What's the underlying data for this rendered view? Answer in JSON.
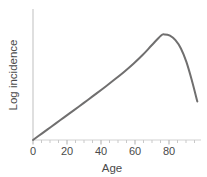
{
  "chart_data": {
    "type": "line",
    "title": "",
    "xlabel": "Age",
    "ylabel": "Log incidence",
    "xlim": [
      0,
      92
    ],
    "ylim": [
      0,
      100
    ],
    "grid": false,
    "legend": null,
    "x_ticks": [
      0,
      20,
      40,
      60,
      80
    ],
    "x_tick_labels": [
      "0",
      "20",
      "40",
      "60",
      "80"
    ],
    "x_minor_tick_step": 5,
    "y_ticks": [],
    "y_tick_labels": [],
    "series": [
      {
        "name": "Log incidence by age",
        "color": "#706f6f",
        "line_width": 2,
        "x": [
          0,
          5,
          10,
          15,
          20,
          25,
          30,
          35,
          40,
          45,
          50,
          55,
          60,
          65,
          70,
          72,
          75,
          78,
          81,
          84,
          87,
          90
        ],
        "y": [
          0,
          5.2,
          10.4,
          15.6,
          20.8,
          26.0,
          31.3,
          36.6,
          42.0,
          47.6,
          53.4,
          59.6,
          66.4,
          74.0,
          81.5,
          82.5,
          81.6,
          78.0,
          71.5,
          61.0,
          46.5,
          30.0
        ]
      }
    ]
  },
  "axes": {
    "axis_color": "#d2d2d2",
    "tick_color": "#bdbdbd",
    "text_color": "#4a4a4a"
  },
  "labels": {
    "x_axis_title": "Age",
    "y_axis_title": "Log incidence",
    "tick_0": "0",
    "tick_20": "20",
    "tick_40": "40",
    "tick_60": "60",
    "tick_80": "80"
  }
}
